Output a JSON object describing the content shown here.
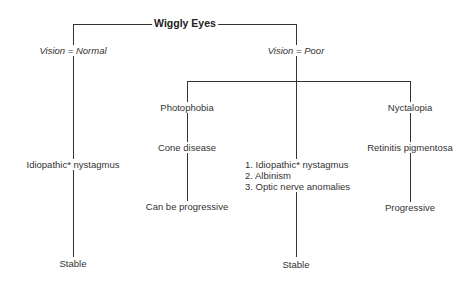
{
  "diagram": {
    "root": "Wiggly Eyes",
    "branches": {
      "normal": {
        "condition": "Vision = Normal",
        "diagnosis": "Idiopathic* nystagmus",
        "outcome": "Stable"
      },
      "poor": {
        "condition": "Vision = Poor",
        "sub": [
          {
            "symptom": "Photophobia",
            "diagnosis": "Cone disease",
            "outcome": "Can be progressive"
          },
          {
            "list": [
              "1. Idiopathic* nystagmus",
              "2. Albinism",
              "3. Optic nerve anomalies"
            ],
            "outcome": "Stable"
          },
          {
            "symptom": "Nyctalopia",
            "diagnosis": "Retinitis pigmentosa",
            "outcome": "Progressive"
          }
        ]
      }
    },
    "colors": {
      "line": "#333333",
      "text": "#333333",
      "background": "#ffffff"
    }
  }
}
